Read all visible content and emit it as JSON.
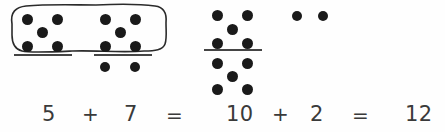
{
  "canvas": {
    "width": 445,
    "height": 132,
    "background": "#fefefe",
    "ink": "#1a1a1a"
  },
  "worksheet": {
    "kind": "dot-pattern-addition-diagram",
    "description": "Making ten: five-dot groups regrouped into a ten-frame stack",
    "equation_top": "5 + 7 = 10 + 2 = 12"
  },
  "dot_groups": [
    {
      "id": "group-a",
      "name": "five-dots-left",
      "count": 5,
      "pattern": "quincunx",
      "circled": true,
      "dots": [
        {
          "x": 22,
          "y": 14
        },
        {
          "x": 52,
          "y": 14
        },
        {
          "x": 37,
          "y": 27
        },
        {
          "x": 22,
          "y": 41
        },
        {
          "x": 52,
          "y": 41
        }
      ]
    },
    {
      "id": "group-b",
      "name": "five-dots-middle",
      "count": 5,
      "pattern": "quincunx",
      "circled": true,
      "dots": [
        {
          "x": 100,
          "y": 14
        },
        {
          "x": 130,
          "y": 14
        },
        {
          "x": 115,
          "y": 27
        },
        {
          "x": 100,
          "y": 41
        },
        {
          "x": 130,
          "y": 41
        }
      ]
    },
    {
      "id": "group-c",
      "name": "two-dots-leftover-below",
      "count": 2,
      "pattern": "pair",
      "circled": false,
      "dots": [
        {
          "x": 100,
          "y": 62
        },
        {
          "x": 130,
          "y": 62
        }
      ]
    },
    {
      "id": "group-d",
      "name": "five-dots-ten-upper",
      "count": 5,
      "pattern": "quincunx",
      "circled": false,
      "dots": [
        {
          "x": 212,
          "y": 10
        },
        {
          "x": 242,
          "y": 10
        },
        {
          "x": 227,
          "y": 24
        },
        {
          "x": 212,
          "y": 38
        },
        {
          "x": 242,
          "y": 38
        }
      ]
    },
    {
      "id": "group-e",
      "name": "five-dots-ten-lower",
      "count": 5,
      "pattern": "quincunx",
      "circled": false,
      "dots": [
        {
          "x": 212,
          "y": 58
        },
        {
          "x": 242,
          "y": 58
        },
        {
          "x": 227,
          "y": 71
        },
        {
          "x": 212,
          "y": 84
        },
        {
          "x": 242,
          "y": 84
        }
      ]
    },
    {
      "id": "group-f",
      "name": "two-dots-right",
      "count": 2,
      "pattern": "pair",
      "circled": false,
      "dots": [
        {
          "x": 292,
          "y": 11
        },
        {
          "x": 318,
          "y": 11
        }
      ]
    }
  ],
  "rules": [
    {
      "id": "rule-a",
      "name": "underline-left-group",
      "x": 14,
      "y": 54,
      "width": 58
    },
    {
      "id": "rule-b",
      "name": "underline-middle-group",
      "x": 94,
      "y": 54,
      "width": 58
    },
    {
      "id": "rule-c",
      "name": "ten-frame-divider",
      "x": 204,
      "y": 49,
      "width": 58
    }
  ],
  "loop": {
    "name": "hand-drawn-circle-around-two-fives",
    "stroke": "#2b2b2b",
    "stroke_width": 1.6,
    "path": "M12,24 C10,12 16,7 26,6 C48,4 74,5 96,5 C118,4 140,4 155,6 C164,7 167,13 166,23 C166,31 167,39 165,44 C163,50 155,51 144,51 C120,53 96,50 72,51 C50,52 30,53 22,51 C14,49 12,43 12,35 Z"
  },
  "equation": {
    "terms": [
      {
        "id": "t1",
        "name": "addend-5",
        "text": "5",
        "x": 42,
        "y": 104
      },
      {
        "id": "t2",
        "name": "plus-1",
        "text": "+",
        "x": 82,
        "y": 104
      },
      {
        "id": "t3",
        "name": "addend-7",
        "text": "7",
        "x": 124,
        "y": 104
      },
      {
        "id": "t4",
        "name": "equals-1",
        "text": "=",
        "x": 166,
        "y": 105
      },
      {
        "id": "t5",
        "name": "sum-10",
        "text": "10",
        "x": 226,
        "y": 104
      },
      {
        "id": "t6",
        "name": "plus-2",
        "text": "+",
        "x": 272,
        "y": 104
      },
      {
        "id": "t7",
        "name": "addend-2",
        "text": "2",
        "x": 310,
        "y": 104
      },
      {
        "id": "t8",
        "name": "equals-2",
        "text": "=",
        "x": 352,
        "y": 105
      },
      {
        "id": "t9",
        "name": "total-12",
        "text": "12",
        "x": 405,
        "y": 104
      }
    ]
  }
}
